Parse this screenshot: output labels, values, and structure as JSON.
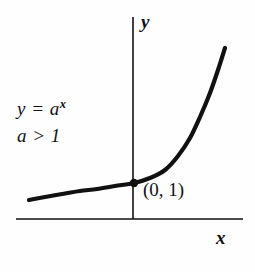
{
  "figure": {
    "background_color": "#fefefe",
    "ink_color": "#111111"
  },
  "axes": {
    "y_label": "y",
    "x_label": "x",
    "x_axis_line": {
      "x1": 16,
      "y1": 219,
      "x2": 243,
      "y2": 219
    },
    "y_axis_line": {
      "x1": 133,
      "y1": 17,
      "x2": 133,
      "y2": 219
    },
    "stroke_width": 1.6
  },
  "annotations": {
    "equation_base": "y = a",
    "equation_exponent": "x",
    "condition": "a > 1",
    "point_label": "(0, 1)"
  },
  "marker": {
    "name": "y-intercept-point",
    "cx": 134,
    "cy": 183,
    "r": 4.2
  },
  "chart_data": {
    "type": "line",
    "xlabel": "x",
    "ylabel": "y",
    "grid": false,
    "legend": null,
    "annotations": [
      "y = a^x",
      "a > 1",
      "(0, 1)"
    ],
    "series": [
      {
        "name": "y = a^x",
        "stroke_width": 4.2,
        "points_px": [
          [
            29,
            200
          ],
          [
            45,
            197
          ],
          [
            62,
            194
          ],
          [
            80,
            191
          ],
          [
            97,
            189
          ],
          [
            115,
            186
          ],
          [
            134,
            183
          ],
          [
            150,
            178
          ],
          [
            165,
            170
          ],
          [
            178,
            156
          ],
          [
            190,
            138
          ],
          [
            200,
            117
          ],
          [
            210,
            93
          ],
          [
            218,
            70
          ],
          [
            225,
            48
          ]
        ]
      }
    ],
    "marked_points": [
      {
        "label": "(0, 1)",
        "x": 0,
        "y": 1,
        "px": [
          134,
          183
        ]
      }
    ],
    "axis_origin_px": [
      133,
      219
    ]
  }
}
